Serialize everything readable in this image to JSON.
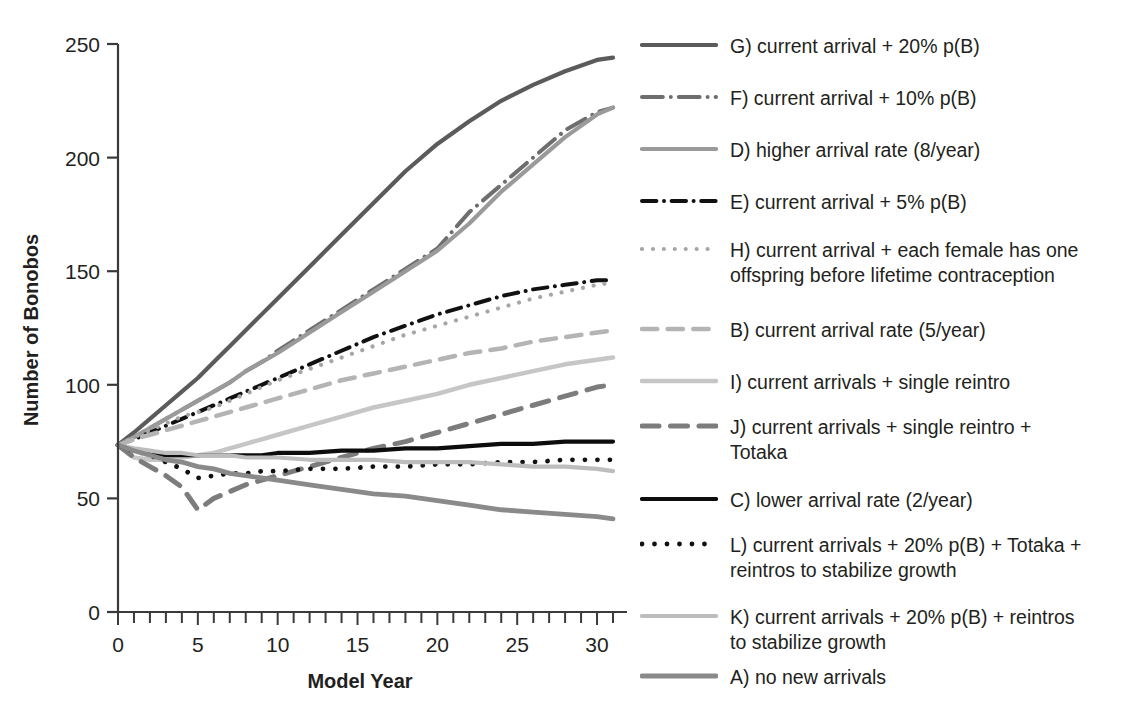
{
  "chart_data": {
    "type": "line",
    "title": "",
    "xlabel": "Model Year",
    "ylabel": "Number of Bonobos",
    "xlim": [
      0,
      31
    ],
    "ylim": [
      0,
      250
    ],
    "xticks": [
      0,
      5,
      10,
      15,
      20,
      25,
      30
    ],
    "xtick_labels": [
      "0",
      "5",
      "10",
      "15",
      "20",
      "25",
      "30"
    ],
    "x_minor_tick_step": 1,
    "yticks": [
      0,
      50,
      100,
      150,
      200,
      250
    ],
    "ytick_labels": [
      "0",
      "50",
      "100",
      "150",
      "200",
      "250"
    ],
    "grid": false,
    "legend_position": "right",
    "x": [
      0,
      1,
      2,
      3,
      4,
      5,
      6,
      7,
      8,
      9,
      10,
      12,
      14,
      16,
      18,
      20,
      22,
      24,
      26,
      28,
      30,
      31
    ],
    "series": [
      {
        "key": "G",
        "name": "G) current arrival + 20% p(B)",
        "color": "#5b5b5b",
        "style": "solid",
        "width": 4.2,
        "values": [
          73.5,
          79,
          85,
          91,
          97,
          103,
          110,
          117,
          124,
          131,
          138,
          152,
          166,
          180,
          194,
          206,
          216,
          225,
          232,
          238,
          243,
          244
        ]
      },
      {
        "key": "F",
        "name": "F) current arrival + 10% p(B)",
        "color": "#6e6e6e",
        "style": "dash-dot-long",
        "width": 4.0,
        "values": [
          73.5,
          77,
          81,
          85,
          89,
          93,
          97,
          101,
          106,
          110,
          115,
          124,
          133,
          142,
          151,
          160,
          176,
          188,
          200,
          212,
          220,
          222
        ]
      },
      {
        "key": "D",
        "name": "D) higher arrival rate (8/year)",
        "color": "#9a9a9a",
        "style": "solid",
        "width": 4.2,
        "values": [
          73.5,
          77,
          81,
          85,
          89,
          93,
          97,
          101,
          106,
          110,
          114,
          123,
          132,
          141,
          150,
          159,
          171,
          185,
          197,
          209,
          219,
          222
        ]
      },
      {
        "key": "E",
        "name": "E) current arrival + 5% p(B)",
        "color": "#111111",
        "style": "dash-dot",
        "width": 4.0,
        "values": [
          73.5,
          76,
          79,
          82,
          85,
          88,
          91,
          94,
          97,
          100,
          103,
          109,
          115,
          121,
          126,
          131,
          135,
          139,
          142,
          144,
          146,
          146
        ]
      },
      {
        "key": "H",
        "name": "H) current arrival + each female has one offspring before lifetime contraception",
        "color": "#a6a6a6",
        "style": "dotted",
        "width": 4.2,
        "values": [
          73.5,
          77,
          80,
          83,
          86,
          88,
          90,
          93,
          96,
          99,
          102,
          107,
          112,
          117,
          122,
          126,
          130,
          134,
          138,
          141,
          144,
          145
        ]
      },
      {
        "key": "B",
        "name": "B) current arrival rate (5/year)",
        "color": "#b4b4b4",
        "style": "dashed-wide",
        "width": 4.5,
        "values": [
          73.5,
          76,
          78,
          80,
          82,
          84,
          86,
          88,
          90,
          92,
          94,
          98,
          102,
          105,
          108,
          111,
          114,
          116,
          119,
          121,
          123,
          124
        ]
      },
      {
        "key": "I",
        "name": "I) current arrivals + single reintro",
        "color": "#c6c6c6",
        "style": "solid",
        "width": 4.5,
        "values": [
          73.5,
          68,
          67,
          67,
          68,
          69,
          70,
          72,
          74,
          76,
          78,
          82,
          86,
          90,
          93,
          96,
          100,
          103,
          106,
          109,
          111,
          112
        ]
      },
      {
        "key": "J",
        "name": "J) current arrivals + single reintro + Totaka",
        "color": "#7c7c7c",
        "style": "dashed-wide",
        "width": 5.0,
        "values": [
          73.5,
          68,
          64,
          60,
          55,
          45,
          50,
          53,
          56,
          58,
          60,
          64,
          68,
          72,
          75,
          79,
          83,
          87,
          91,
          95,
          99,
          100
        ]
      },
      {
        "key": "C",
        "name": "C) lower arrival rate (2/year)",
        "color": "#0d0d0d",
        "style": "solid",
        "width": 4.2,
        "values": [
          73.5,
          71,
          70,
          69,
          69,
          69,
          69,
          69,
          69,
          69,
          70,
          70,
          71,
          71,
          72,
          72,
          73,
          74,
          74,
          75,
          75,
          75
        ]
      },
      {
        "key": "L",
        "name": "L) current arrivals + 20% p(B) + Totaka + reintros to stabilize growth",
        "color": "#111111",
        "style": "dotted",
        "width": 4.8,
        "values": [
          73.5,
          71,
          69,
          66,
          63,
          59,
          60,
          61,
          61,
          62,
          62,
          63,
          63,
          64,
          64,
          65,
          65,
          66,
          66,
          67,
          67,
          67
        ]
      },
      {
        "key": "K",
        "name": "K) current arrivals + 20% p(B) + reintros to stabilize growth",
        "color": "#bdbdbd",
        "style": "solid",
        "width": 4.2,
        "values": [
          73.5,
          72,
          71,
          70,
          70,
          69,
          69,
          69,
          68,
          68,
          68,
          67,
          67,
          67,
          66,
          66,
          66,
          65,
          64,
          64,
          63,
          62
        ]
      },
      {
        "key": "A",
        "name": "A) no new arrivals",
        "color": "#8a8a8a",
        "style": "solid",
        "width": 4.8,
        "values": [
          73.5,
          71,
          69,
          67,
          66,
          64,
          63,
          61,
          60,
          59,
          58,
          56,
          54,
          52,
          51,
          49,
          47,
          45,
          44,
          43,
          42,
          41
        ]
      }
    ]
  },
  "axes": {
    "ylabel": "Number of Bonobos",
    "xlabel": "Model Year"
  },
  "legend": {
    "items": [
      {
        "key": "G",
        "label": "G) current arrival + 20% p(B)"
      },
      {
        "key": "F",
        "label": "F) current arrival + 10% p(B)"
      },
      {
        "key": "D",
        "label": "D) higher arrival rate (8/year)"
      },
      {
        "key": "E",
        "label": "E) current arrival + 5% p(B)"
      },
      {
        "key": "H",
        "label": "H) current arrival + each female has one\noffspring before lifetime contraception"
      },
      {
        "key": "B",
        "label": "B) current arrival rate (5/year)"
      },
      {
        "key": "I",
        "label": "I) current arrivals + single reintro"
      },
      {
        "key": "J",
        "label": "J) current arrivals + single reintro +\nTotaka"
      },
      {
        "key": "C",
        "label": "C) lower arrival rate (2/year)"
      },
      {
        "key": "L",
        "label": "L) current arrivals + 20% p(B) + Totaka +\nreintros to stabilize growth"
      },
      {
        "key": "K",
        "label": "K) current arrivals + 20% p(B) + reintros\nto stabilize growth"
      },
      {
        "key": "A",
        "label": "A) no new arrivals"
      }
    ]
  },
  "colors": {
    "axis": "#3a3a3a",
    "text": "#231f20",
    "background": "#ffffff"
  }
}
